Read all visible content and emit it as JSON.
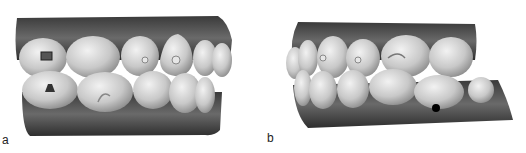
{
  "figure": {
    "panels": [
      {
        "id": "a",
        "label": "a",
        "description": "Lateral view of dental arch model in occlusion, right side, with attachments on posterior teeth"
      },
      {
        "id": "b",
        "label": "b",
        "description": "Lateral view of dental arch model in occlusion, left side, with black marker dot on lower molar"
      }
    ]
  }
}
